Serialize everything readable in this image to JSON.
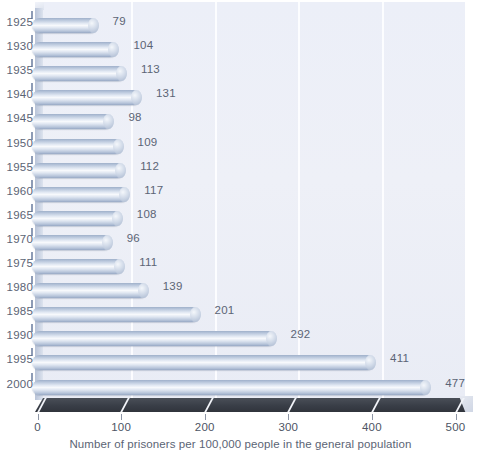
{
  "chart_data": {
    "type": "bar",
    "orientation": "horizontal",
    "title": "",
    "xlabel": "Number of prisoners per 100,000 people in the general population",
    "ylabel": "",
    "categories": [
      "1925",
      "1930",
      "1935",
      "1940",
      "1945",
      "1950",
      "1955",
      "1960",
      "1965",
      "1970",
      "1975",
      "1980",
      "1985",
      "1990",
      "1995",
      "2000"
    ],
    "values": [
      79,
      104,
      113,
      131,
      98,
      109,
      112,
      117,
      108,
      96,
      111,
      139,
      201,
      292,
      411,
      477
    ],
    "value_labels": [
      "79",
      "104",
      "113",
      "131",
      "98",
      "109",
      "112",
      "117",
      "108",
      "96",
      "111",
      "139",
      "201",
      "292",
      "411",
      "477"
    ],
    "xlim": [
      0,
      500
    ],
    "xticks": [
      0,
      100,
      200,
      300,
      400,
      500
    ],
    "xtick_labels": [
      "0",
      "100",
      "200",
      "300",
      "400",
      "500"
    ],
    "gridlines": [
      100,
      200,
      300,
      400
    ],
    "grid": true,
    "legend": null,
    "legend_position": "none",
    "style": "3d-cylinder",
    "colors": {
      "bar_light": "#f7f9fc",
      "bar_mid": "#c7d2e3",
      "bar_dark": "#97a8c4",
      "plot_background": "#eef0f7",
      "page_background": "#ffffff",
      "floor": "#393e47",
      "gridline": "#fdfdff",
      "text": "#5b6475"
    }
  },
  "axes": {
    "x_title": "Number of prisoners per 100,000 people in the general population"
  }
}
